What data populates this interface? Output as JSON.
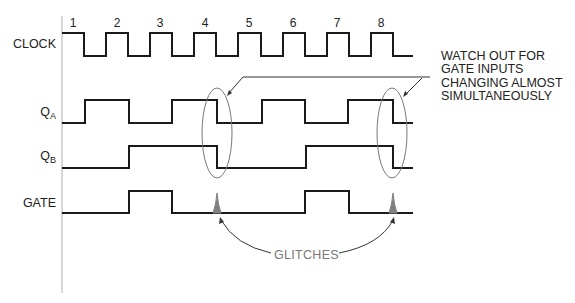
{
  "diagram": {
    "title": "",
    "cycle_numbers": [
      "1",
      "2",
      "3",
      "4",
      "5",
      "6",
      "7",
      "8"
    ],
    "signals": [
      {
        "name": "CLOCK",
        "main": "CLOCK",
        "sub": ""
      },
      {
        "name": "QA",
        "main": "Q",
        "sub": "A"
      },
      {
        "name": "QB",
        "main": "Q",
        "sub": "B"
      },
      {
        "name": "GATE",
        "main": "GATE",
        "sub": ""
      }
    ],
    "annotations": {
      "warning": "WATCH OUT FOR\nGATE INPUTS\nCHANGING ALMOST\nSIMULTANEOUSLY",
      "glitches": "GLITCHES"
    },
    "waveforms": {
      "clock_sequence": "1010101010101010",
      "qa_sequence": "0110011001100110",
      "qb_sequence": "0001111000011110",
      "gate_sequence": "0001100000011000",
      "glitch_cycles": [
        4,
        8
      ]
    },
    "colors": {
      "trace": "#1a1a1a",
      "axis": "#b0b0b0",
      "ellipse": "#777777",
      "glitch": "#808080",
      "glitch_label": "#777777"
    }
  }
}
